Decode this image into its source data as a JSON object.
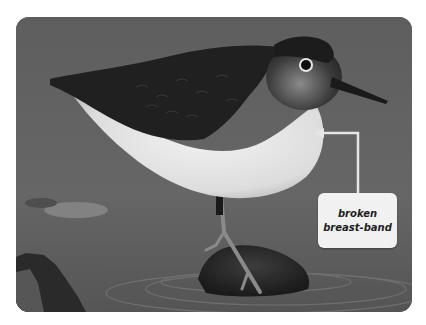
{
  "photo": {
    "subject": "sandpiper standing on rock in water",
    "style": "grayscale",
    "colors": {
      "background": "#626262",
      "water_dark": "#4a4a4a",
      "bird_back": "#1f1f1f",
      "bird_belly": "#e8e8e8",
      "callout_line": "#e6e6e6",
      "label_bg": "#f1f1f1",
      "label_text": "#1e1e1e"
    }
  },
  "annotation": {
    "label_line1": "broken",
    "label_line2": "breast-band",
    "icon": "callout-arrow-icon"
  }
}
